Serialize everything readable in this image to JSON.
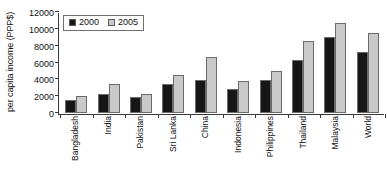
{
  "chart_data": {
    "type": "bar",
    "title": "",
    "xlabel": "",
    "ylabel": "per capita income (PPP$)",
    "ylim": [
      0,
      12000
    ],
    "y_ticks": [
      0,
      2000,
      4000,
      6000,
      8000,
      10000,
      12000
    ],
    "y_tick_labels": [
      "0",
      "2000",
      "4000",
      "6000",
      "8000",
      "10000",
      "12000"
    ],
    "grid": false,
    "legend_position": "upper left",
    "categories": [
      "Bangladesh",
      "India",
      "Pakistan",
      "Sri Lanka",
      "China",
      "Indonesia",
      "Philippines",
      "Thailand",
      "Malaysia",
      "World"
    ],
    "series": [
      {
        "name": "2000",
        "color": "#161616",
        "values": [
          1600,
          2250,
          1900,
          3450,
          3950,
          2900,
          3900,
          6250,
          9000,
          7250
        ]
      },
      {
        "name": "2005",
        "color": "#c9c9c9",
        "values": [
          2000,
          3450,
          2250,
          4500,
          6700,
          3800,
          5050,
          8600,
          10700,
          9500
        ]
      }
    ]
  },
  "legend": {
    "entries": [
      {
        "label": "2000"
      },
      {
        "label": "2005"
      }
    ]
  }
}
